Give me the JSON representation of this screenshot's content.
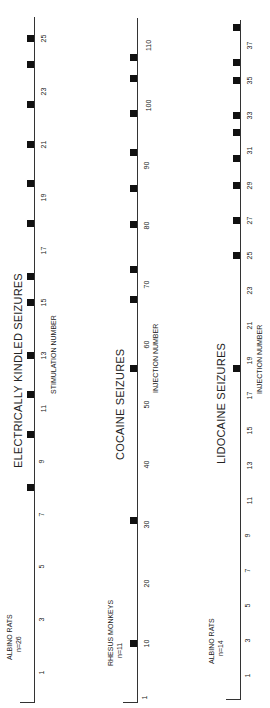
{
  "chart_data": [
    {
      "type": "scatter",
      "title": "ELECTRICALLY KINDLED SEIZURES",
      "group_label": "ALBINO RATS",
      "n_label": "n=26",
      "xlabel": "STIMULATION NUMBER",
      "ylabel": "",
      "tick_labels": [
        "1",
        "3",
        "5",
        "7",
        "9",
        "11",
        "13",
        "15",
        "17",
        "19",
        "21",
        "23",
        "25"
      ],
      "xlim": [
        0,
        25.5
      ],
      "values": [
        8,
        10,
        11.5,
        13,
        15,
        16,
        18,
        19.5,
        21,
        22.5,
        24,
        25
      ],
      "marker": "filled-square",
      "orientation": "rotated-90-ccw"
    },
    {
      "type": "scatter",
      "title": "COCAINE SEIZURES",
      "group_label": "RHESUS MONKEYS",
      "n_label": "n=11",
      "xlabel": "INJECTION NUMBER",
      "ylabel": "",
      "tick_labels": [
        "1",
        "10",
        "20",
        "30",
        "40",
        "50",
        "60",
        "70",
        "80",
        "90",
        "100",
        "110"
      ],
      "xlim": [
        0,
        112
      ],
      "values": [
        10,
        30.5,
        56,
        67.5,
        72.5,
        80,
        86,
        92,
        98.5,
        104.5,
        108
      ],
      "marker": "filled-square",
      "orientation": "rotated-90-ccw"
    },
    {
      "type": "scatter",
      "title": "LIDOCAINE SEIZURES",
      "group_label": "ALBINO RATS",
      "n_label": "n=14",
      "xlabel": "INJECTION NUMBER",
      "ylabel": "",
      "tick_labels": [
        "1",
        "3",
        "5",
        "7",
        "9",
        "11",
        "13",
        "15",
        "17",
        "19",
        "21",
        "23",
        "25",
        "27",
        "29",
        "31",
        "33",
        "35",
        "37"
      ],
      "xlim": [
        0,
        38.5
      ],
      "values": [
        18.5,
        25,
        27,
        29,
        30.5,
        32,
        33,
        35,
        36,
        38
      ],
      "marker": "filled-square",
      "orientation": "rotated-90-ccw"
    }
  ],
  "layout": [
    {
      "axis_x": 34,
      "axis_top": 17,
      "axis_bottom": 702,
      "tick_x": 40,
      "v0": 1,
      "y0": 672,
      "px_per_unit": 26.4,
      "title_x": 12,
      "title_y": 468,
      "xlabel_x": 50,
      "xlabel_y": 394,
      "group_x": 5,
      "group_y": 660
    },
    {
      "axis_x": 137,
      "axis_top": 18,
      "axis_bottom": 702,
      "tick_x": 143,
      "v0": 1,
      "y0": 697,
      "px_per_unit": 5.98,
      "title_x": 114,
      "title_y": 460,
      "xlabel_x": 152,
      "xlabel_y": 393,
      "group_x": 106,
      "group_y": 666
    },
    {
      "axis_x": 240,
      "axis_top": 20,
      "axis_bottom": 699,
      "tick_x": 246,
      "v0": 1,
      "y0": 675,
      "px_per_unit": 17.5,
      "title_x": 215,
      "title_y": 464,
      "xlabel_x": 256,
      "xlabel_y": 394,
      "group_x": 207,
      "group_y": 664
    }
  ]
}
